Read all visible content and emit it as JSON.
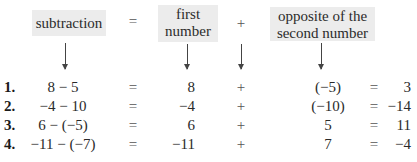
{
  "header": {
    "subtraction_label": "subtraction",
    "equals_sign": "=",
    "first_number_label_line1": "first",
    "first_number_label_line2": "number",
    "plus_sign": "+",
    "opposite_label_line1": "opposite of the",
    "opposite_label_line2": "second number"
  },
  "rows": [
    {
      "label": "1.",
      "expression": "8 − 5",
      "eq1": "=",
      "first": "8",
      "plus": "+",
      "opposite": "(−5)",
      "eq2": "=",
      "result": "3"
    },
    {
      "label": "2.",
      "expression": "−4 − 10",
      "eq1": "=",
      "first": "−4",
      "plus": "+",
      "opposite": "(−10)",
      "eq2": "=",
      "result": "−14"
    },
    {
      "label": "3.",
      "expression": "6 − (−5)",
      "eq1": "=",
      "first": "6",
      "plus": "+",
      "opposite": "5",
      "eq2": "=",
      "result": "11"
    },
    {
      "label": "4.",
      "expression": "−11 − (−7)",
      "eq1": "=",
      "first": "−11",
      "plus": "+",
      "opposite": "7",
      "eq2": "=",
      "result": "−4"
    }
  ],
  "colors": {
    "box_background": "#ececec",
    "text": "#2a2a2a",
    "operator": "#555555"
  }
}
